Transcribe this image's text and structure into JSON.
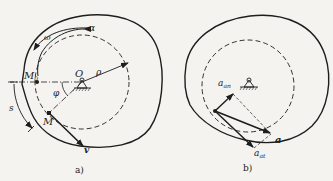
{
  "figure_a": {
    "caption": "a)",
    "labels": {
      "alpha": "α",
      "omega": "ω",
      "m0": "M",
      "m0_sub": "0",
      "origin": "O",
      "rho": "ρ",
      "phi": "φ",
      "s": "s",
      "m": "M",
      "v": "v"
    }
  },
  "figure_b": {
    "caption": "b)",
    "labels": {
      "a_an": "a",
      "a_an_sub": "an",
      "a": "a",
      "a_at": "a",
      "a_at_sub": "at"
    }
  },
  "colors": {
    "ink": "#1e1e1e",
    "paper": "#f4f3ef"
  }
}
